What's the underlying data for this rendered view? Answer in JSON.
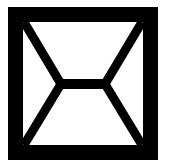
{
  "diagram": {
    "stroke_color": "#000000",
    "background_color": "#ffffff"
  }
}
